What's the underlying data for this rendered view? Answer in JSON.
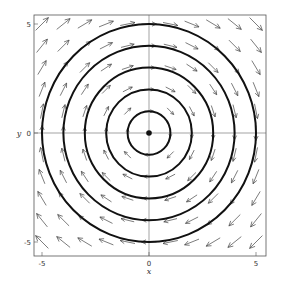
{
  "chart_data": {
    "type": "vector_field",
    "title": "",
    "xlabel": "x",
    "ylabel": "y",
    "xlim": [
      -5.4,
      5.4
    ],
    "ylim": [
      -5.6,
      5.6
    ],
    "x_ticks": [
      -5,
      0,
      5
    ],
    "y_ticks": [
      -5,
      0,
      5
    ],
    "x_tick_labels": [
      "-5",
      "0",
      "5"
    ],
    "y_tick_labels": [
      "-5",
      "0",
      "5"
    ],
    "grid": false,
    "center_lines": true,
    "field": {
      "description": "clockwise rotation F(x, y) = (y, -x)",
      "u": "y",
      "v": "-x",
      "grid_x": [
        -5,
        -4,
        -3,
        -2,
        -1,
        0,
        1,
        2,
        3,
        4,
        5
      ],
      "grid_y": [
        -5,
        -4,
        -3,
        -2,
        -1,
        0,
        1,
        2,
        3,
        4,
        5
      ]
    },
    "circles": {
      "center": [
        0,
        0
      ],
      "radii": [
        1,
        2,
        3,
        4,
        5
      ]
    },
    "origin_marker": [
      0,
      0
    ]
  },
  "colors": {
    "background": "#ffffff",
    "frame": "#555555",
    "arrows": "#444444",
    "circles": "#111111"
  }
}
